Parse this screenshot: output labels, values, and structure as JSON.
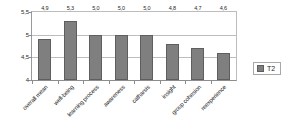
{
  "chart_data": {
    "type": "bar",
    "title": "",
    "xlabel": "",
    "ylabel": "",
    "ylim": [
      4,
      5.5
    ],
    "grid": true,
    "legend_position": "right",
    "categories": [
      "overall mean",
      "well-being",
      "learning process",
      "awareness",
      "catharsis",
      "insight",
      "group cohesion",
      "reexperience"
    ],
    "series": [
      {
        "name": "T2",
        "color": "#7f7f7f",
        "values": [
          4.9,
          5.3,
          5.0,
          5.0,
          5.0,
          4.8,
          4.7,
          4.6
        ],
        "data_labels": [
          "4,9",
          "5,3",
          "5,0",
          "5,0",
          "5,0",
          "4,8",
          "4,7",
          "4,6"
        ]
      }
    ],
    "yticks": [
      {
        "value": 5.5,
        "label": "5,5"
      },
      {
        "value": 5.0,
        "label": "5"
      },
      {
        "value": 4.5,
        "label": "4,5"
      },
      {
        "value": 4.0,
        "label": "4"
      }
    ]
  },
  "legend": {
    "entries": [
      {
        "label": "T2",
        "color": "#7f7f7f"
      }
    ]
  }
}
